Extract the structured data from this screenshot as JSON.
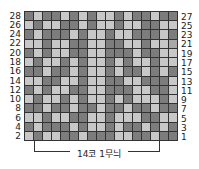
{
  "title": "",
  "left_labels": [
    "28",
    "26",
    "24",
    "22",
    "20",
    "18",
    "16",
    "14",
    "12",
    "10",
    "8",
    "6",
    "4",
    "2"
  ],
  "right_labels": [
    "27",
    "25",
    "23",
    "21",
    "19",
    "17",
    "15",
    "13",
    "11",
    "9",
    "7",
    "5",
    "3",
    "1"
  ],
  "repeat_label": "14코 1무늬",
  "grid": {
    "columns": 17,
    "rows": 14,
    "pattern": [
      "dlddldldlldlddldd",
      "ldllddldlldllddll",
      "dldddldlldlldddld",
      "lldllddllddlldllx",
      "dldllddlldddlddll",
      "ldlldldlldldlldll",
      "ddlddldlldlddldld",
      "llddlldllddlldddl",
      "dldllddlldddllddl",
      "ldlldldlldldllldl",
      "ddlddlddlddlddldd",
      "lldllddlldlllddll",
      "dldddldlldlddldld",
      "ldllddldddllddldd"
    ],
    "colors": {
      "dark": "#7d7d7d",
      "mid": "#a8a8a8",
      "light": "#c8c8c8",
      "line": "#333333"
    }
  }
}
